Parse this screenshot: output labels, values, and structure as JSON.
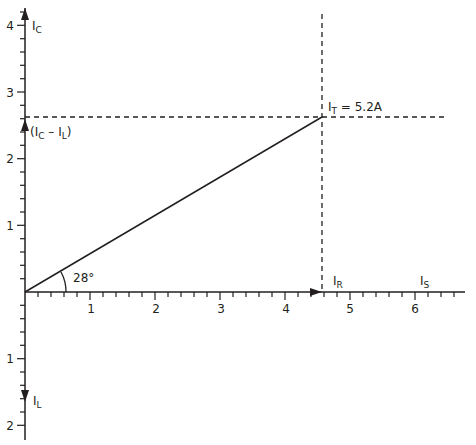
{
  "diagram": {
    "x_axis": {
      "tick_labels": [
        "1",
        "2",
        "3",
        "4",
        "5",
        "6"
      ],
      "minor_ticks_per_unit": 5,
      "range": [
        0,
        6.6
      ]
    },
    "y_axis_up": {
      "tick_labels": [
        "1",
        "2",
        "3",
        "4"
      ],
      "label_main": "I",
      "label_sub": "C"
    },
    "y_axis_down": {
      "tick_labels": [
        "1",
        "2"
      ],
      "label_main": "I",
      "label_sub": "L"
    },
    "labels": {
      "ic_minus_il": {
        "open": "(I",
        "sub1": "C",
        "mid": " – I",
        "sub2": "L",
        "close": ")"
      },
      "it": {
        "main": "I",
        "sub": "T",
        "rest": " = 5.2A"
      },
      "ir": {
        "main": "I",
        "sub": "R"
      },
      "is": {
        "main": "I",
        "sub": "S"
      },
      "angle": "28°"
    },
    "phasors": {
      "IT": {
        "x": 4.58,
        "y": 2.44,
        "magnitude_A": 5.2,
        "angle_deg": 28
      },
      "IR": {
        "x": 4.58,
        "y": 0
      },
      "IC_minus_IL": {
        "x": 0,
        "y": 2.44
      }
    },
    "colors": {
      "line": "#231f20",
      "background": "#ffffff"
    }
  }
}
